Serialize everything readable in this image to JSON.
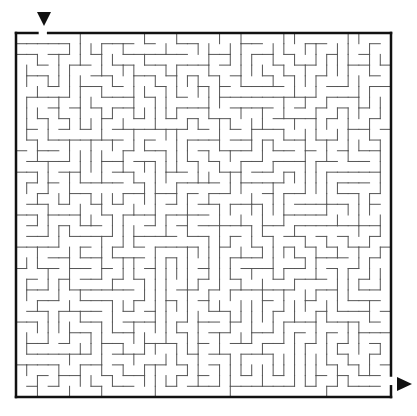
{
  "maze": {
    "cols": 35,
    "rows": 34,
    "frame": {
      "left": 16,
      "top": 33,
      "right": 391,
      "bottom": 397
    },
    "entrance": {
      "side": "top",
      "col": 2
    },
    "exit": {
      "side": "right",
      "row": 32
    },
    "seed": 20240611,
    "wall_color": "#555555",
    "frame_color": "#111111",
    "start_marker": {
      "x": 44,
      "y": 20,
      "glyph": "triangle-down"
    },
    "end_marker": {
      "x": 404,
      "y": 384,
      "glyph": "triangle-right"
    }
  }
}
